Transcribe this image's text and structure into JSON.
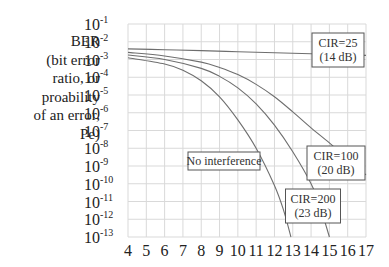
{
  "chart_data": {
    "type": "line",
    "title": "",
    "xlabel": "",
    "ylabel_lines": [
      "BER",
      "(bit error",
      "ratio, or",
      "proability",
      "of an error,",
      "Pe)"
    ],
    "yscale": "log",
    "xlim": [
      4,
      17
    ],
    "ylim_exponents": [
      -13,
      -1
    ],
    "x_ticks": [
      "4",
      "5",
      "6",
      "7",
      "8",
      "9",
      "10",
      "11",
      "12",
      "13",
      "14",
      "15",
      "16",
      "17"
    ],
    "y_ticks": [
      {
        "base": "10",
        "exp": "-1"
      },
      {
        "base": "10",
        "exp": "-2"
      },
      {
        "base": "10",
        "exp": "-3"
      },
      {
        "base": "10",
        "exp": "-4"
      },
      {
        "base": "10",
        "exp": "-5"
      },
      {
        "base": "10",
        "exp": "-6"
      },
      {
        "base": "10",
        "exp": "-7"
      },
      {
        "base": "10",
        "exp": "-8"
      },
      {
        "base": "10",
        "exp": "-9"
      },
      {
        "base": "10",
        "exp": "-10"
      },
      {
        "base": "10",
        "exp": "-11"
      },
      {
        "base": "10",
        "exp": "-12"
      },
      {
        "base": "10",
        "exp": "-13"
      }
    ],
    "grid": true,
    "series": [
      {
        "name": "CIR=25 (14 dB)",
        "label_lines": [
          "CIR=25",
          "(14 dB)"
        ],
        "x": [
          4,
          6,
          8,
          10,
          12,
          14,
          16,
          17
        ],
        "log10_y": [
          -2.4,
          -2.45,
          -2.5,
          -2.56,
          -2.62,
          -2.68,
          -2.74,
          -2.77
        ]
      },
      {
        "name": "CIR=100 (20 dB)",
        "label_lines": [
          "CIR=100",
          "(20 dB)"
        ],
        "x": [
          4,
          6,
          8,
          9,
          10,
          11,
          12,
          13,
          14,
          15,
          16,
          17
        ],
        "log10_y": [
          -2.6,
          -2.8,
          -3.15,
          -3.45,
          -3.85,
          -4.4,
          -5.1,
          -5.95,
          -6.85,
          -7.7,
          -8.6,
          -9.5
        ]
      },
      {
        "name": "CIR=200 (23 dB)",
        "label_lines": [
          "CIR=200",
          "(23 dB)"
        ],
        "x": [
          4,
          6,
          8,
          9,
          10,
          11,
          12,
          13,
          14,
          14.5,
          15
        ],
        "log10_y": [
          -2.75,
          -3.0,
          -3.5,
          -3.95,
          -4.6,
          -5.5,
          -6.7,
          -8.2,
          -10.0,
          -11.3,
          -13.0
        ]
      },
      {
        "name": "No interference",
        "label_lines": [
          "No interference"
        ],
        "x": [
          4,
          6,
          7,
          8,
          9,
          10,
          11,
          12,
          12.5,
          12.9
        ],
        "log10_y": [
          -2.9,
          -3.25,
          -3.6,
          -4.2,
          -5.1,
          -6.4,
          -8.0,
          -10.1,
          -11.5,
          -13.0
        ]
      }
    ]
  }
}
